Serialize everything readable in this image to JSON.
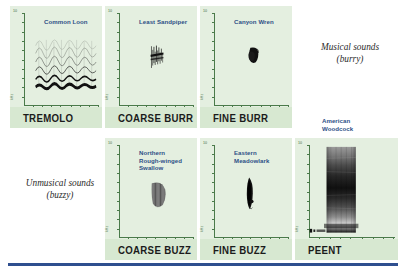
{
  "figure": {
    "axis": {
      "y_max_label": "10",
      "y_unit_label": "kHz",
      "x_mid_label": "0.5",
      "x_unit_label": "sec"
    },
    "annotations": [
      {
        "id": "musical",
        "text": "Musical sounds\n(burry)"
      },
      {
        "id": "unmusical",
        "text": "Unmusical sounds\n(buzzy)"
      }
    ],
    "panels": [
      {
        "id": "tremolo",
        "species": "Common Loon",
        "term": "TREMOLO",
        "spectrogram": "wavy-harmonic-bands"
      },
      {
        "id": "coarse-burr",
        "species": "Least Sandpiper",
        "term": "COARSE BURR",
        "spectrogram": "narrow-jagged-burst"
      },
      {
        "id": "fine-burr",
        "species": "Canyon Wren",
        "term": "FINE BURR",
        "spectrogram": "small-dark-blob"
      },
      {
        "id": "coarse-buzz",
        "species": "Northern\nRough-winged\nSwallow",
        "term": "COARSE BUZZ",
        "spectrogram": "comb-striped-wedge"
      },
      {
        "id": "fine-buzz",
        "species": "Eastern\nMeadowlark",
        "term": "FINE BUZZ",
        "spectrogram": "tall-narrow-lens"
      },
      {
        "id": "peent",
        "species": "American\nWoodcock",
        "term": "PEENT",
        "spectrogram": "broadband-column"
      }
    ],
    "colors": {
      "panel_background": "#e4efe0",
      "term_band": "#d7e8d1",
      "axis": "#4a7a4a",
      "species_label": "#2e4f86",
      "rule": "#2f4f8f",
      "annotation": "#2b2b2b"
    }
  }
}
